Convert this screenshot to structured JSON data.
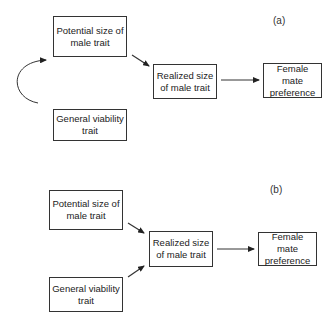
{
  "panels": [
    {
      "label": "(a)",
      "nodes": {
        "potential": {
          "line1": "Potential size of",
          "line2": "male trait"
        },
        "viability": {
          "line1": "General viability",
          "line2": "trait"
        },
        "realized": {
          "line1": "Realized size",
          "line2": "of male trait"
        },
        "female": {
          "line1": "Female mate",
          "line2": "preference"
        }
      },
      "edges": [
        {
          "from": "viability",
          "to": "potential",
          "style": "curved"
        },
        {
          "from": "potential",
          "to": "realized",
          "style": "straight"
        },
        {
          "from": "realized",
          "to": "female",
          "style": "straight"
        }
      ]
    },
    {
      "label": "(b)",
      "nodes": {
        "potential": {
          "line1": "Potential size of",
          "line2": "male trait"
        },
        "viability": {
          "line1": "General viability",
          "line2": "trait"
        },
        "realized": {
          "line1": "Realized size",
          "line2": "of male trait"
        },
        "female": {
          "line1": "Female mate",
          "line2": "preference"
        }
      },
      "edges": [
        {
          "from": "potential",
          "to": "realized",
          "style": "straight"
        },
        {
          "from": "viability",
          "to": "realized",
          "style": "straight"
        },
        {
          "from": "realized",
          "to": "female",
          "style": "straight"
        }
      ]
    }
  ],
  "colors": {
    "line": "#333333",
    "background": "#ffffff"
  }
}
